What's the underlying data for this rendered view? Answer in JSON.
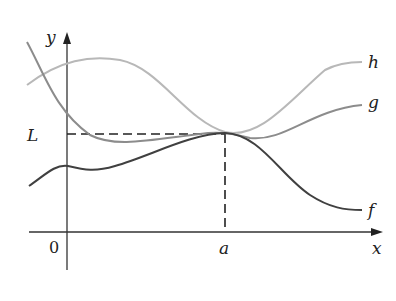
{
  "diagram": {
    "axes": {
      "x_label": "x",
      "y_label": "y",
      "origin_label": "0"
    },
    "point_labels": {
      "a": "a",
      "L": "L"
    },
    "curves": [
      {
        "name": "h",
        "label": "h",
        "color": "#b8b8b8"
      },
      {
        "name": "g",
        "label": "g",
        "color": "#8c8c8c"
      },
      {
        "name": "f",
        "label": "f",
        "color": "#404040"
      }
    ]
  }
}
